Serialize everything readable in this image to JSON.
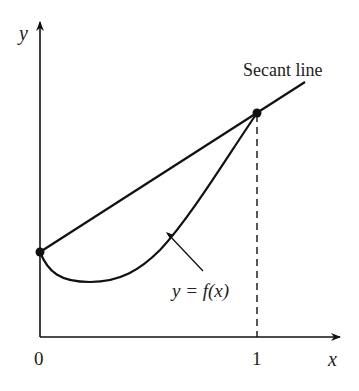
{
  "diagram": {
    "axes": {
      "x_label": "x",
      "y_label": "y",
      "x_ticks": [
        "0",
        "1"
      ]
    },
    "labels": {
      "secant": "Secant line",
      "curve": "y = f(x)"
    },
    "colors": {
      "ink": "#111111",
      "background": "#ffffff"
    },
    "points": [
      {
        "name": "left-endpoint",
        "x": 0,
        "description": "(0, f(0))"
      },
      {
        "name": "right-endpoint",
        "x": 1,
        "description": "(1, f(1))"
      }
    ]
  }
}
